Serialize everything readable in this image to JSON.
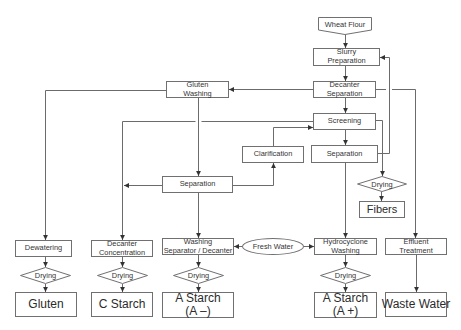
{
  "diagram": {
    "type": "process-flowchart",
    "colors": {
      "line": "#6b6b6b",
      "box_border": "#707070",
      "text": "#333333",
      "background": "#ffffff"
    },
    "nodes": {
      "wheat_flour": {
        "shape": "offpage-connector",
        "label": [
          "Wheat Flour"
        ]
      },
      "slurry_preparation": {
        "shape": "rect",
        "label": [
          "Slurry",
          "Preparation"
        ]
      },
      "decanter_separation": {
        "shape": "rect",
        "label": [
          "Decanter",
          "Separation"
        ]
      },
      "gluten_washing": {
        "shape": "rect",
        "label": [
          "Gluten",
          "Washing"
        ]
      },
      "screening": {
        "shape": "rect",
        "label": [
          "Screening"
        ]
      },
      "clarification": {
        "shape": "rect",
        "label": [
          "Clarification"
        ]
      },
      "separation_main": {
        "shape": "rect",
        "label": [
          "Separation"
        ]
      },
      "separation_gluten": {
        "shape": "rect",
        "label": [
          "Separation"
        ]
      },
      "drying_fibers": {
        "shape": "diamond",
        "label": [
          "Drying"
        ]
      },
      "fibers": {
        "shape": "rect",
        "label": [
          "Fibers"
        ]
      },
      "dewatering": {
        "shape": "rect",
        "label": [
          "Dewatering"
        ]
      },
      "decanter_concentration": {
        "shape": "rect",
        "label": [
          "Decanter",
          "Concentration"
        ]
      },
      "washing_separator": {
        "shape": "rect",
        "label": [
          "Washing",
          "Separator / Decanter"
        ]
      },
      "fresh_water": {
        "shape": "ellipse",
        "label": [
          "Fresh Water"
        ]
      },
      "hydrocyclone_washing": {
        "shape": "rect",
        "label": [
          "Hydrocyclone",
          "Washing"
        ]
      },
      "effluent_treatment": {
        "shape": "rect",
        "label": [
          "Effluent",
          "Treatment"
        ]
      },
      "drying_gluten": {
        "shape": "diamond",
        "label": [
          "Drying"
        ]
      },
      "drying_c_starch": {
        "shape": "diamond",
        "label": [
          "Drying"
        ]
      },
      "drying_a_minus": {
        "shape": "diamond",
        "label": [
          "Drying"
        ]
      },
      "drying_a_plus": {
        "shape": "diamond",
        "label": [
          "Drying"
        ]
      },
      "gluten": {
        "shape": "rect",
        "label": [
          "Gluten"
        ]
      },
      "c_starch": {
        "shape": "rect",
        "label": [
          "C Starch"
        ]
      },
      "a_starch_minus": {
        "shape": "rect",
        "label": [
          "A Starch",
          "(A –)"
        ]
      },
      "a_starch_plus": {
        "shape": "rect",
        "label": [
          "A Starch",
          "(A +)"
        ]
      },
      "waste_water": {
        "shape": "rect",
        "label": [
          "Waste Water"
        ]
      }
    },
    "edges": [
      {
        "from": "wheat_flour",
        "to": "slurry_preparation"
      },
      {
        "from": "slurry_preparation",
        "to": "decanter_separation"
      },
      {
        "from": "decanter_separation",
        "to": "gluten_washing"
      },
      {
        "from": "decanter_separation",
        "to": "screening"
      },
      {
        "from": "decanter_separation",
        "to": "effluent_treatment"
      },
      {
        "from": "gluten_washing",
        "to": "dewatering"
      },
      {
        "from": "gluten_washing",
        "to": "separation_gluten"
      },
      {
        "from": "screening",
        "to": "separation_main"
      },
      {
        "from": "screening",
        "to": "decanter_concentration"
      },
      {
        "from": "screening",
        "to": "drying_fibers"
      },
      {
        "from": "separation_gluten",
        "to": "decanter_concentration"
      },
      {
        "from": "separation_gluten",
        "to": "clarification"
      },
      {
        "from": "separation_gluten",
        "to": "washing_separator"
      },
      {
        "from": "clarification",
        "to": "screening"
      },
      {
        "from": "separation_main",
        "to": "slurry_preparation"
      },
      {
        "from": "separation_main",
        "to": "hydrocyclone_washing"
      },
      {
        "from": "drying_fibers",
        "to": "fibers"
      },
      {
        "from": "fresh_water",
        "to": "washing_separator"
      },
      {
        "from": "fresh_water",
        "to": "hydrocyclone_washing"
      },
      {
        "from": "dewatering",
        "to": "drying_gluten"
      },
      {
        "from": "drying_gluten",
        "to": "gluten"
      },
      {
        "from": "decanter_concentration",
        "to": "drying_c_starch"
      },
      {
        "from": "drying_c_starch",
        "to": "c_starch"
      },
      {
        "from": "washing_separator",
        "to": "drying_a_minus"
      },
      {
        "from": "drying_a_minus",
        "to": "a_starch_minus"
      },
      {
        "from": "hydrocyclone_washing",
        "to": "drying_a_plus"
      },
      {
        "from": "drying_a_plus",
        "to": "a_starch_plus"
      },
      {
        "from": "effluent_treatment",
        "to": "waste_water"
      }
    ]
  }
}
